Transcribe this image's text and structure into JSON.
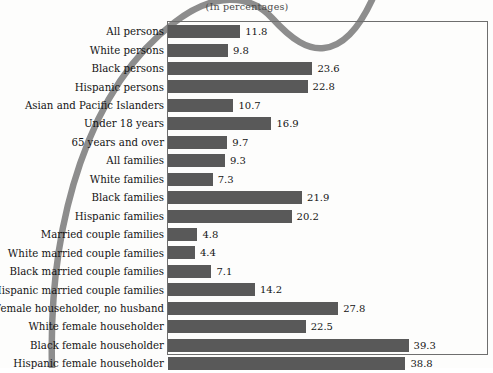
{
  "chart_data": {
    "type": "bar",
    "orientation": "horizontal",
    "title": "(In percentages)",
    "xlabel": "",
    "ylabel": "",
    "xlim": [
      0,
      41
    ],
    "grid": false,
    "legend": null,
    "bar_color": "#595959",
    "frame_color": "#6e6e6e",
    "categories": [
      "All persons",
      "White persons",
      "Black persons",
      "Hispanic persons",
      "Asian and Pacific Islanders",
      "Under 18 years",
      "65 years and over",
      "All families",
      "White families",
      "Black families",
      "Hispanic families",
      "Married couple families",
      "White married couple families",
      "Black married couple families",
      "Hispanic married couple families",
      "Female householder, no husband",
      "White female householder",
      "Black female householder",
      "Hispanic female householder"
    ],
    "values": [
      11.8,
      9.8,
      23.6,
      22.8,
      10.7,
      16.9,
      9.7,
      9.3,
      7.3,
      21.9,
      20.2,
      4.8,
      4.4,
      7.1,
      14.2,
      27.8,
      22.5,
      39.3,
      38.8
    ],
    "value_labels": [
      "11.8",
      "9.8",
      "23.6",
      "22.8",
      "10.7",
      "16.9",
      "9.7",
      "9.3",
      "7.3",
      "21.9",
      "20.2",
      "4.8",
      "4.4",
      "7.1",
      "14.2",
      "27.8",
      "22.5",
      "39.3",
      "38.8"
    ]
  },
  "decoration": {
    "curve_color": "#8d8d8d",
    "curve_name": "decorative-swoosh"
  }
}
